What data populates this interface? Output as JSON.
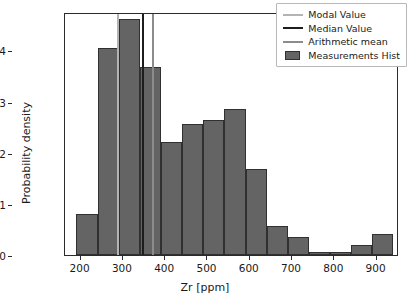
{
  "chart_data": {
    "type": "bar",
    "title": "",
    "xlabel": "Zr [ppm]",
    "ylabel": "Probability density",
    "xlim": [
      163,
      953
    ],
    "ylim": [
      0.0,
      0.00475
    ],
    "grid": false,
    "legend_position": "upper right",
    "bin_width": 50,
    "bin_edges": [
      190,
      240,
      290,
      340,
      390,
      440,
      490,
      540,
      590,
      640,
      690,
      740,
      790,
      840,
      890,
      940
    ],
    "categories": [
      "190-240",
      "240-290",
      "290-340",
      "340-390",
      "390-440",
      "440-490",
      "490-540",
      "540-590",
      "590-640",
      "640-690",
      "690-740",
      "740-790",
      "790-840",
      "840-890",
      "890-940"
    ],
    "values": [
      0.0008,
      0.00404,
      0.00462,
      0.00367,
      0.0022,
      0.00257,
      0.00264,
      0.00286,
      0.00169,
      0.00057,
      0.00035,
      6e-05,
      6e-05,
      0.0002,
      0.00042
    ],
    "series": [
      {
        "name": "Measurements Hist",
        "values": [
          0.0008,
          0.00404,
          0.00462,
          0.00367,
          0.0022,
          0.00257,
          0.00264,
          0.00286,
          0.00169,
          0.00057,
          0.00035,
          6e-05,
          6e-05,
          0.0002,
          0.00042
        ],
        "color": "#646464"
      }
    ],
    "xticks": [
      200,
      300,
      400,
      500,
      600,
      700,
      800,
      900
    ],
    "xticklabels": [
      "200",
      "300",
      "400",
      "500",
      "600",
      "700",
      "800",
      "900"
    ],
    "yticks": [
      0.0,
      0.001,
      0.002,
      0.003,
      0.004
    ],
    "yticklabels": [
      "0.000",
      "0.001",
      "0.002",
      "0.003",
      "0.004"
    ],
    "vlines": [
      {
        "name": "Modal Value",
        "x": 288,
        "color": "#b4b4b4"
      },
      {
        "name": "Median Value",
        "x": 348,
        "color": "#1d1d1d"
      },
      {
        "name": "Arithmetic mean",
        "x": 370,
        "color": "#8c8c8c"
      }
    ]
  },
  "legend": {
    "items": [
      {
        "label": "Modal Value",
        "kind": "line",
        "color": "#b4b4b4"
      },
      {
        "label": "Median Value",
        "kind": "line",
        "color": "#1d1d1d"
      },
      {
        "label": "Arithmetic mean",
        "kind": "line",
        "color": "#8c8c8c"
      },
      {
        "label": "Measurements Hist",
        "kind": "patch",
        "color": "#646464"
      }
    ]
  }
}
